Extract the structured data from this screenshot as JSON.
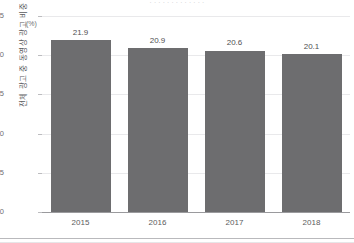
{
  "figure": {
    "top_caption": "· · ·  · · · · · ·  · · · ·",
    "y_axis_title": "전체 광고 중 동영상 광고 비중",
    "unit_label": "(%)"
  },
  "chart_data": {
    "type": "bar",
    "title": "",
    "subtitle": "",
    "xlabel": "",
    "ylabel": "전체 광고 중 동영상 광고 비중",
    "unit": "(%)",
    "categories": [
      "2015",
      "2016",
      "2017",
      "2018"
    ],
    "values": [
      21.9,
      20.9,
      20.6,
      20.1
    ],
    "value_labels": [
      "21.9",
      "20.9",
      "20.6",
      "20.1"
    ],
    "series": [
      {
        "name": "전체 광고 중 동영상 광고 비중",
        "values": [
          21.9,
          20.9,
          20.6,
          20.1
        ],
        "color": "#6d6d6f"
      }
    ],
    "ylim": [
      0,
      25
    ],
    "yticks": [
      0,
      5,
      10,
      15,
      20,
      25
    ],
    "ytick_labels": [
      "0",
      "5",
      "10",
      "15",
      "20",
      "25"
    ],
    "grid": true,
    "grid_axis": "y",
    "legend": false,
    "legend_position": "none",
    "bar_color": "#6d6d6f",
    "gridline_color": "#e9e9eb",
    "axis_color": "#9a9a9d"
  }
}
